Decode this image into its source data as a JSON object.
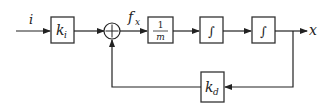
{
  "diagram": {
    "type": "block-diagram",
    "signals": {
      "input": "i",
      "force": "f",
      "force_sub": "x",
      "output": "x"
    },
    "blocks": {
      "ki": {
        "main": "k",
        "sub": "i"
      },
      "inv_mass": {
        "num": "1",
        "den": "m"
      },
      "integrator1": {
        "symbol": "∫"
      },
      "integrator2": {
        "symbol": "∫"
      },
      "kd": {
        "main": "k",
        "sub": "d"
      }
    },
    "summing_junction": {
      "symbol": "+"
    },
    "colors": {
      "line": "#222222",
      "box_border": "#333333",
      "background": "#ffffff"
    }
  }
}
